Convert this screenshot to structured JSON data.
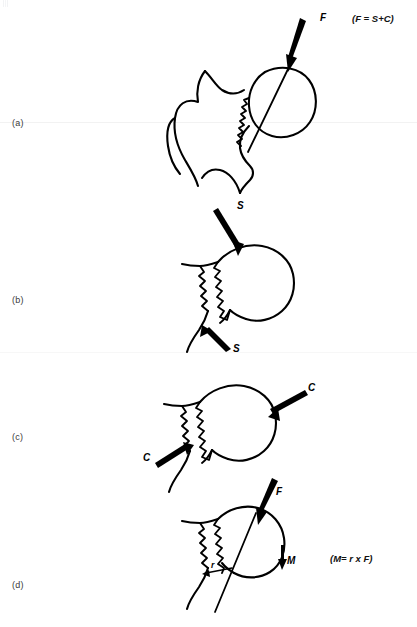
{
  "figure": {
    "background_color": "#ffffff",
    "stroke_color": "#000000",
    "label_color": "#3a3a3a",
    "width": 417,
    "height": 627
  },
  "panels": [
    {
      "id": "a",
      "label": "(a)",
      "formula": "(F = S+C)",
      "description": "Proximal femur with fracture line; resultant force F applied across femoral head",
      "vectors": [
        {
          "name": "F",
          "label": "F",
          "type": "straight-arrow",
          "meaning": "resultant force"
        }
      ]
    },
    {
      "id": "b",
      "label": "(b)",
      "formula": "",
      "description": "Femoral head and neck fragment with shear forces acting parallel to the fracture plane",
      "vectors": [
        {
          "name": "S-upper",
          "label": "S",
          "type": "straight-arrow",
          "meaning": "shear force"
        },
        {
          "name": "S-lower",
          "label": "S",
          "type": "straight-arrow",
          "meaning": "shear force"
        }
      ]
    },
    {
      "id": "c",
      "label": "(c)",
      "formula": "",
      "description": "Femoral head and neck fragment with compressive forces acting perpendicular to the fracture plane",
      "vectors": [
        {
          "name": "C-upper",
          "label": "C",
          "type": "straight-arrow",
          "meaning": "compressive force"
        },
        {
          "name": "C-lower",
          "label": "C",
          "type": "straight-arrow",
          "meaning": "compressive force"
        }
      ]
    },
    {
      "id": "d",
      "label": "(d)",
      "formula": "(M= r x F)",
      "description": "Femoral head with force F, moment arm r, and resulting bending moment M",
      "vectors": [
        {
          "name": "F",
          "label": "F",
          "type": "straight-arrow",
          "meaning": "resultant force"
        },
        {
          "name": "r",
          "label": "r",
          "type": "moment-arm",
          "meaning": "moment arm"
        },
        {
          "name": "M",
          "label": "M",
          "type": "straight-arrow",
          "meaning": "bending moment"
        }
      ]
    }
  ]
}
